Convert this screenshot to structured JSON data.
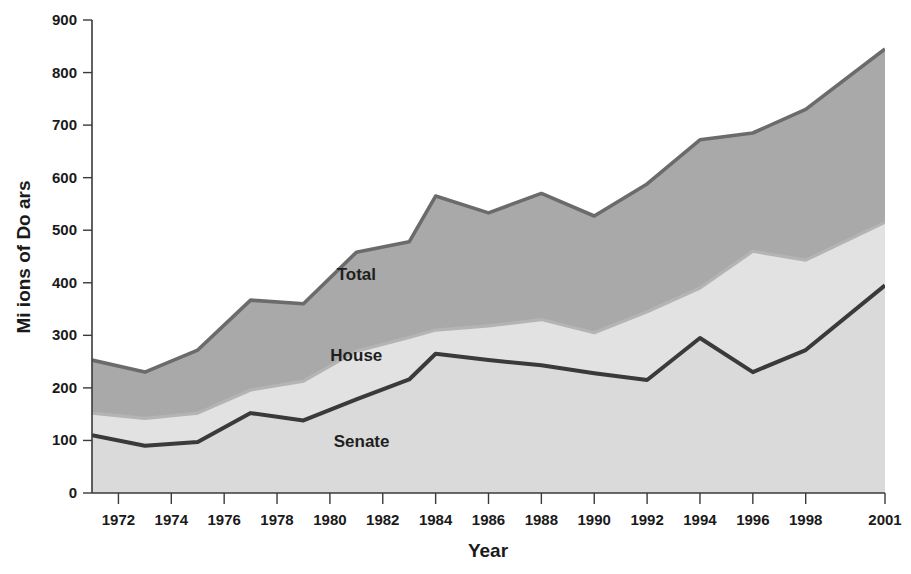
{
  "chart_data": {
    "type": "area",
    "title": "",
    "subtitle": "",
    "xlabel": "Year",
    "ylabel": "Mi ions of Do ars",
    "stacked": false,
    "grid": false,
    "legend_position": "in-plot",
    "xlim": [
      1971,
      2001
    ],
    "ylim": [
      0,
      900
    ],
    "ytick_values": [
      0,
      100,
      200,
      300,
      400,
      500,
      600,
      700,
      800,
      900
    ],
    "ytick_labels": [
      "0",
      "100",
      "200",
      "300",
      "400",
      "500",
      "600",
      "700",
      "800",
      "900"
    ],
    "xtick_values": [
      1972,
      1974,
      1976,
      1978,
      1980,
      1982,
      1984,
      1986,
      1988,
      1990,
      1992,
      1994,
      1996,
      1998,
      2001
    ],
    "xtick_labels": [
      "1972",
      "1974",
      "1976",
      "1978",
      "1980",
      "1982",
      "1984",
      "1986",
      "1988",
      "1990",
      "1992",
      "1994",
      "1996",
      "1998",
      "2001"
    ],
    "x": [
      1971,
      1973,
      1975,
      1977,
      1979,
      1981,
      1983,
      1984,
      1986,
      1988,
      1990,
      1992,
      1994,
      1996,
      1998,
      2001
    ],
    "series": [
      {
        "name": "Total",
        "label": "Total",
        "color": "#a9a9a9",
        "line_color": "#6b6b6b",
        "values": [
          253,
          230,
          272,
          367,
          360,
          458,
          478,
          565,
          533,
          570,
          527,
          588,
          672,
          685,
          730,
          845
        ]
      },
      {
        "name": "House",
        "label": "House",
        "color": "#e2e2e2",
        "line_color": "#b4b4b4",
        "values": [
          152,
          142,
          152,
          196,
          213,
          270,
          296,
          310,
          318,
          330,
          305,
          345,
          390,
          460,
          443,
          515
        ]
      },
      {
        "name": "Senate",
        "label": "Senate",
        "color": "#dadada",
        "line_color": "#3a3a3a",
        "values": [
          110,
          90,
          97,
          152,
          138,
          178,
          216,
          265,
          253,
          243,
          228,
          215,
          295,
          230,
          272,
          395
        ]
      }
    ],
    "annotations": [
      {
        "text": "Total",
        "x": 1981.0,
        "y": 405
      },
      {
        "text": "House",
        "x": 1981.0,
        "y": 252
      },
      {
        "text": "Senate",
        "x": 1981.2,
        "y": 88
      }
    ]
  }
}
